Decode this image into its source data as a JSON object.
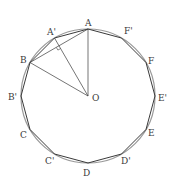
{
  "diagram": {
    "type": "geometry",
    "colors": {
      "stroke": "#3a3a3a",
      "circle": "#9a9a9a",
      "background": "#ffffff"
    },
    "center": {
      "name": "O",
      "x": 88,
      "y": 96,
      "label_x": 92,
      "label_y": 101
    },
    "radius": 67,
    "points": [
      {
        "name": "A",
        "x": 88,
        "y": 29,
        "label_x": 85,
        "label_y": 26
      },
      {
        "name": "A'",
        "x": 54.5,
        "y": 38,
        "label_x": 47,
        "label_y": 35
      },
      {
        "name": "B",
        "x": 30,
        "y": 62.5,
        "label_x": 20,
        "label_y": 63
      },
      {
        "name": "B'",
        "x": 21,
        "y": 96,
        "label_x": 8,
        "label_y": 100
      },
      {
        "name": "C",
        "x": 30,
        "y": 129.5,
        "label_x": 20,
        "label_y": 138
      },
      {
        "name": "C'",
        "x": 54.5,
        "y": 154,
        "label_x": 45,
        "label_y": 164
      },
      {
        "name": "D",
        "x": 88,
        "y": 163,
        "label_x": 83,
        "label_y": 176
      },
      {
        "name": "D'",
        "x": 121.5,
        "y": 154,
        "label_x": 121,
        "label_y": 164
      },
      {
        "name": "E",
        "x": 146,
        "y": 129.5,
        "label_x": 148,
        "label_y": 136
      },
      {
        "name": "E'",
        "x": 155,
        "y": 96,
        "label_x": 158,
        "label_y": 101
      },
      {
        "name": "F",
        "x": 146,
        "y": 62.5,
        "label_x": 148,
        "label_y": 64
      },
      {
        "name": "F'",
        "x": 121.5,
        "y": 38,
        "label_x": 124,
        "label_y": 34
      }
    ],
    "segments": [
      {
        "from": "O",
        "to": "A"
      },
      {
        "from": "O",
        "to": "B"
      },
      {
        "from": "O",
        "to": "A'"
      },
      {
        "from": "B",
        "to": "A"
      }
    ],
    "right_angle_marker": {
      "at": "midpoint of AB on OA'",
      "x": 59,
      "y": 46
    }
  }
}
